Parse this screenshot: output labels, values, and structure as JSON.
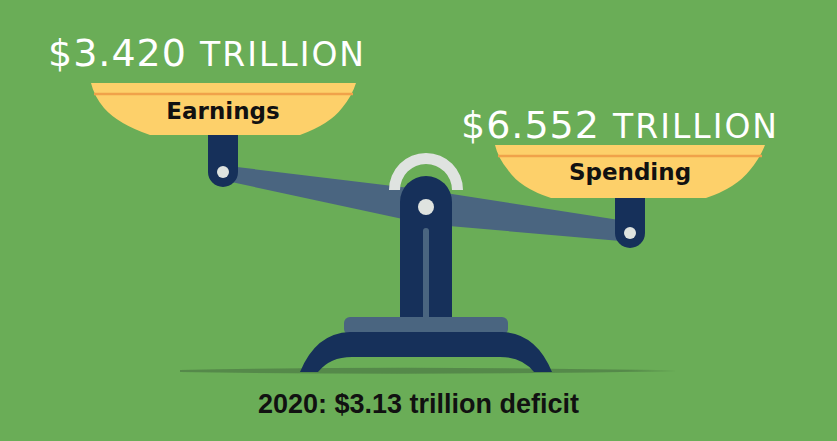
{
  "colors": {
    "background": "#6aad57",
    "pan_fill": "#fdd06a",
    "pan_stripe": "#f0a24a",
    "navy": "#16305a",
    "beam": "#4a6580",
    "highlight": "#dfe3e0",
    "ground_shadow": "#4f7d45",
    "amount_text": "#ffffff",
    "label_text": "#111111"
  },
  "left_pan": {
    "amount_number": "$3.420",
    "amount_unit": "TRILLION",
    "label": "Earnings"
  },
  "right_pan": {
    "amount_number": "$6.552",
    "amount_unit": "TRILLION",
    "label": "Spending"
  },
  "caption": "2020: $3.13 trillion deficit",
  "icons": {
    "scale": "balance-scale-icon"
  }
}
